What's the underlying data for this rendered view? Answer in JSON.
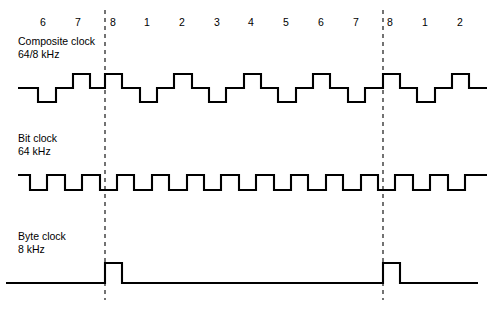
{
  "figure": {
    "background_color": "#ffffff",
    "stroke_color": "#000000",
    "width": 502,
    "height": 314
  },
  "bit_numbers": {
    "label": "Bit position numbers",
    "values": [
      "6",
      "7",
      "8",
      "1",
      "2",
      "3",
      "4",
      "5",
      "6",
      "7",
      "8",
      "1",
      "2"
    ],
    "x_positions": [
      43,
      78,
      113,
      147,
      182,
      217,
      251,
      286,
      321,
      356,
      390,
      425,
      460
    ],
    "y": 26
  },
  "frame_markers": {
    "name": "byte-boundary-markers",
    "style": "dashed",
    "x_positions": [
      105,
      383
    ],
    "y_top": 10,
    "y_bottom": 300
  },
  "signals": [
    {
      "id": "composite-clock",
      "name": "Composite clock",
      "label_line1": "Composite clock",
      "label_line2": "64/8 kHz",
      "frequency": "64/8 kHz",
      "label_x": 18,
      "label_y1": 45,
      "label_y2": 58,
      "levels": {
        "high": 74,
        "mid": 88,
        "low": 102
      },
      "description": "Three-level composite clock: mid baseline with low dips every bit period and a tall high pulse marking bit 8 / byte boundary",
      "path": "M 18,88 L 38,88 L 38,102 L 56,102 L 56,88 L 73,88 L 73,74 L 90,74 L 90,88 L 105,88 L 105,74 L 122,74 L 122,88 L 140,88 L 140,102 L 157,102 L 157,88 L 174,88 L 174,74 L 192,74 L 192,88 L 209,88 L 209,102 L 226,102 L 226,88 L 244,88 L 244,74 L 261,74 L 261,88 L 278,88 L 278,102 L 296,102 L 296,88 L 313,88 L 313,74 L 330,74 L 330,88 L 348,88 L 348,102 L 365,102 L 365,88 L 383,88 L 383,74 L 400,74 L 400,88 L 417,88 L 417,102 L 435,102 L 435,88 L 452,88 L 452,74 L 469,74 L 469,88 L 487,88"
    },
    {
      "id": "bit-clock",
      "name": "Bit clock",
      "label_line1": "Bit clock",
      "label_line2": "64 kHz",
      "frequency": "64 kHz",
      "label_x": 18,
      "label_y1": 142,
      "label_y2": 155,
      "levels": {
        "high": 175,
        "low": 190
      },
      "description": "Regular 64 kHz square wave, one cycle per bit period",
      "path": "M 18,175 L 30,175 L 30,190 L 47,190 L 47,175 L 65,175 L 65,190 L 82,190 L 82,175 L 100,175 L 100,190 L 117,190 L 117,175 L 134,175 L 134,190 L 152,190 L 152,175 L 169,175 L 169,190 L 187,190 L 187,175 L 204,175 L 204,190 L 221,190 L 221,175 L 239,175 L 239,190 L 256,190 L 256,175 L 274,175 L 274,190 L 291,190 L 291,175 L 308,175 L 308,190 L 326,190 L 326,175 L 343,175 L 343,190 L 361,190 L 361,175 L 378,175 L 378,190 L 395,190 L 395,175 L 413,175 L 413,190 L 430,190 L 430,175 L 448,175 L 448,190 L 465,190 L 465,175 L 487,175"
    },
    {
      "id": "byte-clock",
      "name": "Byte clock",
      "label_line1": "Byte clock",
      "label_line2": "8 kHz",
      "frequency": "8 kHz",
      "label_x": 18,
      "label_y1": 240,
      "label_y2": 253,
      "levels": {
        "high": 263,
        "low": 283
      },
      "description": "8 kHz byte clock: one narrow positive pulse at each byte boundary, aligned with the dashed frame markers",
      "path": "M 6,283 L 105,283 L 105,263 L 122,263 L 122,283 L 383,283 L 383,263 L 400,263 L 400,283 L 478,283"
    }
  ]
}
